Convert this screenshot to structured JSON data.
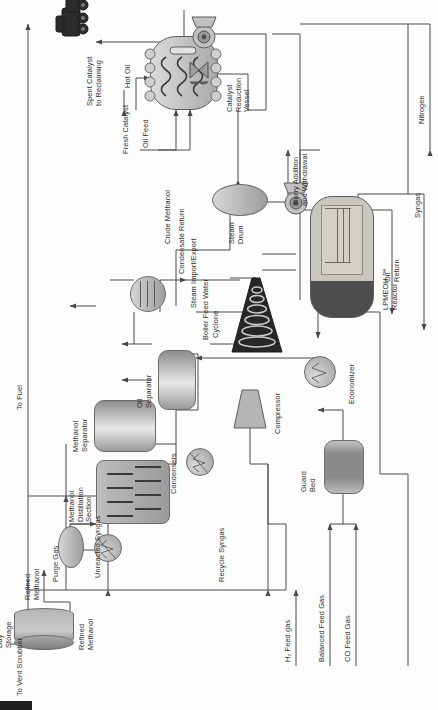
{
  "diagram": {
    "orientation": "rotated-90-ccw",
    "background_color": "#fdfdfd",
    "line_color": "#4a4a4a",
    "text_color": "#2f2f2f"
  },
  "streams": {
    "to_fuel": "To Fuel",
    "purge_gas": "Purge Gas",
    "unreacted_syngas": "Unreacted Syngas",
    "recycle_syngas": "Recycle Syngas",
    "h2_feed_gas": "H₂ Feed gas",
    "balanced_feed_gas": "Balanced Feed Gas",
    "co_feed_gas": "CO Feed Gas",
    "to_vent_scrubber": "To Vent Scrubber",
    "refined_methanol_a": "Refined\nMethanol",
    "refined_methanol_b": "Refined\nMethanol",
    "crude_methanol": "Crude Methanol",
    "condensate_return": "Condensate Return",
    "steam_import_export": "Steam Import/Export",
    "boiler_feed_water": "Boiler Feed Water",
    "fresh_catalyst": "Fresh Catalyst",
    "oil_feed": "Oil Feed",
    "hot_oil": "Hot Oil",
    "spent_catalyst": "Spent Catalyst\nto Reclaiming",
    "slurry_addition": "Slurry Addition\nand Withdrawal",
    "oil_return": "Oil\nReturn",
    "syngas": "Syngas",
    "nitrogen": "Nitrogen"
  },
  "equipment": {
    "day_storage": "Day\nStorage",
    "methanol_distillation": "Methanol\nDistillation\nSection",
    "methanol_separator": "Methanol\nSeparator",
    "condensers": "Condensers",
    "oil_separator": "Oil\nSeparator",
    "compressor": "Compressor",
    "guard_bed": "Guard\nBed",
    "economizer": "Economizer",
    "cyclone": "Cyclone",
    "steam_drum": "Steam\nDrum",
    "lpmeoh_reactor": "LPMEOH ™\nReactor",
    "catalyst_reduction_vessel": "Catalyst\nReduction\nVessel"
  },
  "icons": {
    "truck": "truck-icon",
    "pump": "pump-icon",
    "valve": "control-valve-icon",
    "arrow": "flow-arrow-icon"
  }
}
